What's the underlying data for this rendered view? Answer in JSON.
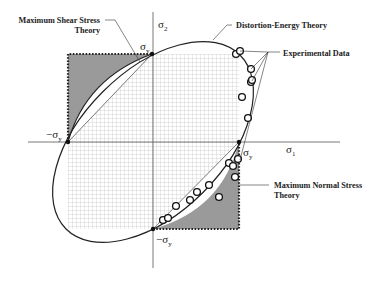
{
  "axes": {
    "x_label": "σ",
    "x_sub": "1",
    "y_label": "σ",
    "y_sub": "2"
  },
  "points": {
    "top": {
      "label": "σ",
      "sub": "y"
    },
    "right": {
      "label": "σ",
      "sub": "y"
    },
    "left": {
      "label": "−σ",
      "sub": "y"
    },
    "bottom": {
      "label": "−σ",
      "sub": "y"
    }
  },
  "legend": {
    "max_shear_line1": "Maximum Shear Stress",
    "max_shear_line2": "Theory",
    "distortion_energy": "Distortion-Energy Theory",
    "experimental": "Experimental Data",
    "max_normal_line1": "Maximum Normal Stress",
    "max_normal_line2": "Theory"
  },
  "colors": {
    "shaded_region": "#9a9a9a",
    "grid": "#b8b8b8",
    "curve": "#222222"
  },
  "experimental_points": [
    [
      236,
      54
    ],
    [
      240,
      51
    ],
    [
      251,
      69
    ],
    [
      251,
      82
    ],
    [
      252,
      80
    ],
    [
      242,
      97
    ],
    [
      248,
      118
    ],
    [
      163,
      220
    ],
    [
      168,
      218
    ],
    [
      176,
      206
    ],
    [
      190,
      200
    ],
    [
      197,
      192
    ],
    [
      209,
      185
    ],
    [
      219,
      197
    ],
    [
      229,
      163
    ],
    [
      233,
      166
    ],
    [
      235,
      177
    ],
    [
      238,
      159
    ]
  ]
}
